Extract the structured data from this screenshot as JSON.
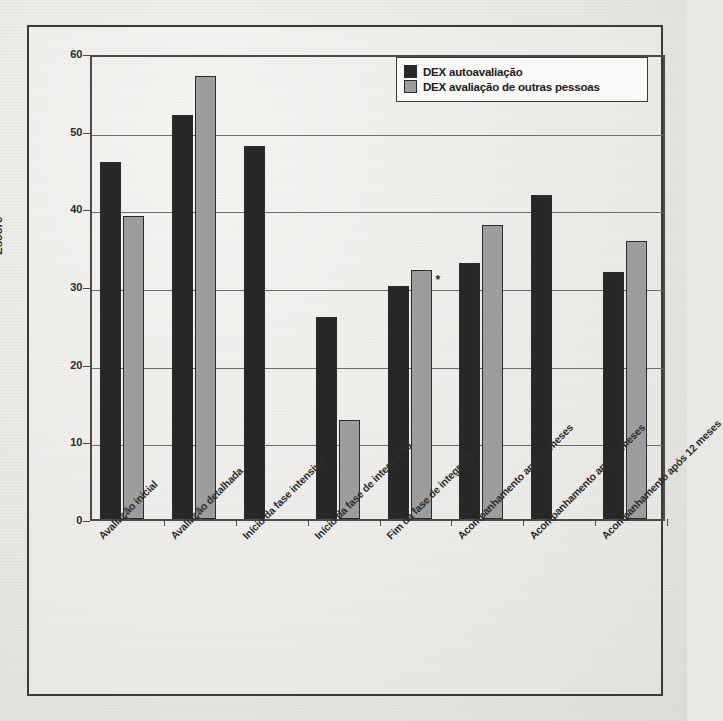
{
  "chart_data": {
    "type": "bar",
    "title": "",
    "xlabel": "",
    "ylabel": "Escore",
    "ylim": [
      0,
      60
    ],
    "yticks": [
      "0",
      "10",
      "20",
      "30",
      "40",
      "50",
      "60"
    ],
    "grid": true,
    "legend_position": "top-right",
    "categories": [
      "Avaliação inicial",
      "Avaliação detalhada",
      "Início da fase intensiva",
      "Início da fase de integração",
      "Fim da fase de integração",
      "Acompanhamento após 3 meses",
      "Acompanhamento após 6 meses",
      "Acompanhamento após 12 meses"
    ],
    "series": [
      {
        "name": "DEX autoavaliação",
        "color": "#272727",
        "values": [
          46,
          52,
          48,
          26,
          30,
          33,
          41.7,
          31.8
        ]
      },
      {
        "name": "DEX avaliação de outras pessoas",
        "color": "#9d9d9d",
        "values": [
          39,
          57,
          null,
          12.8,
          32,
          37.8,
          null,
          35.8
        ]
      }
    ],
    "annotations": [
      {
        "text": "*",
        "category_index": 4,
        "note": "asterisco próximo à barra cinza"
      }
    ]
  },
  "legend": {
    "items": [
      {
        "label": "DEX autoavaliação",
        "swatch": "dark"
      },
      {
        "label": "DEX avaliação de outras pessoas",
        "swatch": "light"
      }
    ]
  },
  "axis": {
    "y_label": "Escore"
  }
}
